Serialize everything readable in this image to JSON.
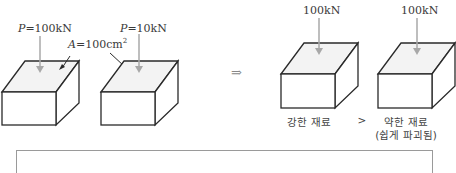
{
  "left_panel": {
    "block1": {
      "force_symbol": "P",
      "force_value": "=100kN"
    },
    "block2": {
      "force_symbol": "P",
      "force_value": "=10kN"
    },
    "area_label": {
      "symbol": "A",
      "value": "=100cm",
      "exponent": "2"
    }
  },
  "implies_arrow": "⇒",
  "right_panel": {
    "block1": {
      "force_label": "100kN",
      "caption": "강한 재료"
    },
    "comparison": ">",
    "block2": {
      "force_label": "100kN",
      "caption": "약한 재료",
      "subcaption": "(쉽게 파괴됨)"
    }
  },
  "summary_box": {
    "left_text": "P = 100kN (partially visible)",
    "right_text": "P = 10kN (partially visible)"
  },
  "colors": {
    "line": "#2a2a2a",
    "arrow": "#a8a8a8",
    "top_face": "#f3f3f3"
  }
}
